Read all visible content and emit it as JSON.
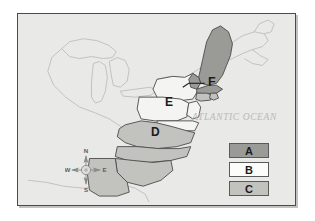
{
  "map": {
    "ocean_label": "ATLANTIC OCEAN",
    "background_color": "#e9e9e7",
    "border_color": "#4a4a4a",
    "outline_color": "#b5b5b3",
    "state_line_color": "#4a4a4a",
    "region_labels": [
      {
        "id": "E",
        "text": "E",
        "fill": "white"
      },
      {
        "id": "D",
        "text": "D",
        "fill": "light-gray"
      },
      {
        "id": "F",
        "text": "F",
        "fill": "light-gray"
      }
    ],
    "fills": {
      "dark_gray": "#9a9a97",
      "light_gray": "#c2c2bf",
      "white": "#f4f4f2"
    }
  },
  "compass": {
    "north": "N",
    "south": "S",
    "east": "E",
    "west": "W"
  },
  "legend": {
    "items": [
      {
        "label": "A",
        "fill": "#9a9a97"
      },
      {
        "label": "B",
        "fill": "#fcfcfb"
      },
      {
        "label": "C",
        "fill": "#c2c2bf"
      }
    ]
  }
}
